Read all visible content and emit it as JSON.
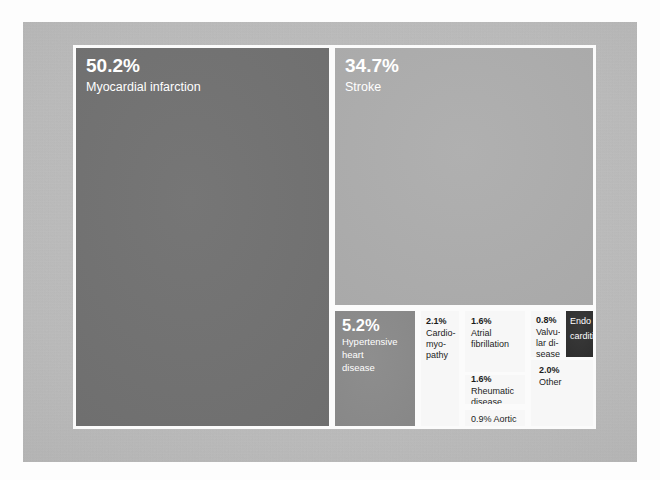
{
  "chart_data": {
    "type": "treemap",
    "title": "",
    "subtitle": "",
    "xlabel": "",
    "ylabel": "",
    "legend": [],
    "units": "percent",
    "categories": [
      "Myocardial infarction",
      "Stroke",
      "Hypertensive heart disease",
      "Cardiomyopathy",
      "Atrial fibrillation",
      "Rheumatic disease",
      "Aortic aneurysm",
      "Valvular disease",
      "Endocarditis",
      "Other"
    ],
    "values": [
      50.2,
      34.7,
      5.2,
      2.1,
      1.6,
      1.6,
      0.9,
      0.8,
      0.0,
      2.0
    ],
    "tiles": [
      {
        "id": "myocardial-infarction",
        "pct": "50.2%",
        "label": "Myocardial infarction",
        "value": 50.2,
        "fill": "#6f6f6f",
        "text_color": "#ffffff"
      },
      {
        "id": "stroke",
        "pct": "34.7%",
        "label": "Stroke",
        "value": 34.7,
        "fill": "#a9a9a9",
        "text_color": "#ffffff"
      },
      {
        "id": "hypertensive-heart-disease",
        "pct": "5.2%",
        "label": "Hypertensive heart disease",
        "label_line1": "Hypertensive",
        "label_line2": "heart",
        "label_line3": "disease",
        "value": 5.2,
        "fill": "#878787",
        "text_color": "#ffffff"
      },
      {
        "id": "cardiomyopathy",
        "pct": "2.1%",
        "label": "Cardio-myo-pathy",
        "label_line1": "Cardio-",
        "label_line2": "myo-",
        "label_line3": "pathy",
        "value": 2.1,
        "fill": "#f7f7f7",
        "text_color": "#1c1c1c"
      },
      {
        "id": "atrial-fibrillation",
        "pct": "1.6%",
        "label": "Atrial fibrillation",
        "label_line1": "Atrial",
        "label_line2": "fibrillation",
        "value": 1.6,
        "fill": "#f7f7f7",
        "text_color": "#1c1c1c"
      },
      {
        "id": "rheumatic-disease",
        "pct": "1.6%",
        "label": "Rheumatic disease",
        "label_line1": "Rheumatic",
        "label_line2": "disease",
        "value": 1.6,
        "fill": "#f7f7f7",
        "text_color": "#1c1c1c"
      },
      {
        "id": "aortic-aneurysm",
        "pct": "0.9%",
        "label": "Aortic aneurysm",
        "label_line1": "0.9% Aortic",
        "label_line2": "aneurysm",
        "value": 0.9,
        "fill": "#f7f7f7",
        "text_color": "#1c1c1c"
      },
      {
        "id": "valvular-disease",
        "pct": "0.8%",
        "label": "Valvular disease",
        "label_line1": "Valvu-",
        "label_line2": "lar di-",
        "label_line3": "sease",
        "value": 0.8,
        "fill": "#f7f7f7",
        "text_color": "#1c1c1c"
      },
      {
        "id": "endocarditis",
        "pct": "",
        "label": "Endocarditis",
        "label_line1": "Endo",
        "label_line2": "carditi",
        "value": 0.0,
        "fill": "#2c2c2c",
        "text_color": "#ffffff"
      },
      {
        "id": "other",
        "pct": "2.0%",
        "label": "Other",
        "label_line1": "Other",
        "value": 2.0,
        "fill": "#f7f7f7",
        "text_color": "#1c1c1c"
      }
    ],
    "colors": {
      "panel_background": "#bdbdbd",
      "gutter": "#fbfbfb",
      "canvas": "#fdfdfd"
    }
  }
}
